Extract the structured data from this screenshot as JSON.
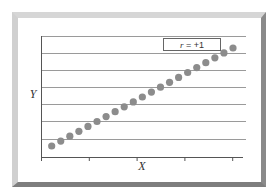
{
  "chart_data": {
    "type": "scatter",
    "title": "",
    "xlabel": "X",
    "ylabel": "Y",
    "legend": {
      "label_var": "r",
      "label_rest": " = +1",
      "position": "top-right"
    },
    "grid": {
      "horizontal": true,
      "vertical": false,
      "lines": 7
    },
    "x_ticks": 5,
    "tick_labels_shown": false,
    "point_color": "#8c8c8c",
    "points": [
      {
        "x": 1,
        "y": 1.0
      },
      {
        "x": 2,
        "y": 1.3
      },
      {
        "x": 3,
        "y": 1.6
      },
      {
        "x": 4,
        "y": 1.9
      },
      {
        "x": 5,
        "y": 2.2
      },
      {
        "x": 6,
        "y": 2.5
      },
      {
        "x": 7,
        "y": 2.8
      },
      {
        "x": 8,
        "y": 3.1
      },
      {
        "x": 9,
        "y": 3.4
      },
      {
        "x": 10,
        "y": 3.7
      },
      {
        "x": 11,
        "y": 4.0
      },
      {
        "x": 12,
        "y": 4.3
      },
      {
        "x": 13,
        "y": 4.6
      },
      {
        "x": 14,
        "y": 4.9
      },
      {
        "x": 15,
        "y": 5.2
      },
      {
        "x": 16,
        "y": 5.5
      },
      {
        "x": 17,
        "y": 5.8
      },
      {
        "x": 18,
        "y": 6.1
      },
      {
        "x": 19,
        "y": 6.4
      },
      {
        "x": 20,
        "y": 6.7
      },
      {
        "x": 21,
        "y": 7.0
      }
    ],
    "correlation": "+1"
  }
}
